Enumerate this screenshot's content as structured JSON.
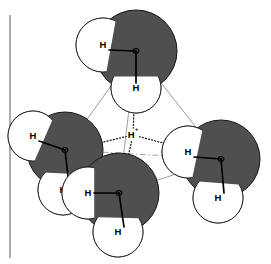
{
  "figure": {
    "name": "eigen-cation-h9o4-plus",
    "caption": "",
    "background_color": "#ffffff",
    "margin_rule": {
      "name": "left-margin-rule",
      "x": 10,
      "y1": 15,
      "y2": 258,
      "color": "#6b6b6b",
      "width": 1.1
    }
  },
  "palette": {
    "oxygen_fill": "#4f4f4f",
    "oxygen_stroke": "#151515",
    "hydrogen_fill": "#ffffff",
    "hydrogen_stroke": "#1a1a1a",
    "bond_color": "#000000",
    "tetrahedron_edge_color": "#8d8d8d",
    "hidden_edge_color": "#9a9a9a",
    "hbond_color": "#1a1a1a",
    "label_color": "#000000"
  },
  "central_proton": {
    "name": "central-proton",
    "label": "H",
    "charge": "+",
    "x": 133,
    "y": 135
  },
  "water_molecules": [
    {
      "name": "water-top",
      "position": "top",
      "oxygen": {
        "label": "O",
        "x": 136,
        "y": 51,
        "r": 41
      },
      "hydrogens": [
        {
          "label": "H",
          "x": 103,
          "y": 45,
          "r": 27,
          "bond_to_o": true
        },
        {
          "label": "H",
          "x": 136,
          "y": 88,
          "r": 25,
          "bond_to_o": true
        }
      ]
    },
    {
      "name": "water-left",
      "position": "left",
      "oxygen": {
        "label": "O",
        "x": 65,
        "y": 150,
        "r": 38
      },
      "hydrogens": [
        {
          "label": "H",
          "x": 33,
          "y": 136,
          "r": 25,
          "bond_to_o": true
        },
        {
          "label": "H",
          "x": 63,
          "y": 190,
          "r": 25,
          "bond_to_o": true
        }
      ]
    },
    {
      "name": "water-right",
      "position": "right",
      "oxygen": {
        "label": "O",
        "x": 221,
        "y": 159,
        "r": 39
      },
      "hydrogens": [
        {
          "label": "H",
          "x": 188,
          "y": 152,
          "r": 26,
          "bond_to_o": true
        },
        {
          "label": "H",
          "x": 218,
          "y": 198,
          "r": 25,
          "bond_to_o": true
        }
      ]
    },
    {
      "name": "water-bottom",
      "position": "bottom-front",
      "oxygen": {
        "label": "O",
        "x": 119,
        "y": 193,
        "r": 40
      },
      "hydrogens": [
        {
          "label": "H",
          "x": 88,
          "y": 193,
          "r": 26,
          "bond_to_o": true
        },
        {
          "label": "H",
          "x": 118,
          "y": 232,
          "r": 25,
          "bond_to_o": true
        }
      ]
    }
  ],
  "tetrahedron_edges": [
    {
      "name": "edge-top-left",
      "x1": 136,
      "y1": 51,
      "x2": 65,
      "y2": 150,
      "style": "solid"
    },
    {
      "name": "edge-top-right",
      "x1": 136,
      "y1": 51,
      "x2": 221,
      "y2": 159,
      "style": "solid"
    },
    {
      "name": "edge-top-bottom",
      "x1": 136,
      "y1": 51,
      "x2": 119,
      "y2": 193,
      "style": "solid"
    },
    {
      "name": "edge-left-bottom",
      "x1": 65,
      "y1": 150,
      "x2": 119,
      "y2": 193,
      "style": "solid"
    },
    {
      "name": "edge-bottom-right",
      "x1": 119,
      "y1": 193,
      "x2": 221,
      "y2": 159,
      "style": "solid"
    },
    {
      "name": "edge-left-right-hidden",
      "x1": 65,
      "y1": 150,
      "x2": 221,
      "y2": 159,
      "style": "dash-dot"
    }
  ],
  "hydrogen_bonds": [
    {
      "name": "hbond-proton-top",
      "x1": 133,
      "y1": 135,
      "x2": 136,
      "y2": 60,
      "style": "dotted"
    },
    {
      "name": "hbond-proton-left",
      "x1": 133,
      "y1": 135,
      "x2": 70,
      "y2": 150,
      "style": "dotted"
    },
    {
      "name": "hbond-proton-right",
      "x1": 133,
      "y1": 135,
      "x2": 216,
      "y2": 157,
      "style": "dotted"
    },
    {
      "name": "hbond-proton-bottom",
      "x1": 133,
      "y1": 135,
      "x2": 121,
      "y2": 188,
      "style": "dotted"
    }
  ]
}
